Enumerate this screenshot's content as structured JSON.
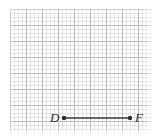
{
  "figure": {
    "width": 157,
    "height": 136,
    "background_color": "#ffffff"
  },
  "grid": {
    "major_line_color": "#b9b9bd",
    "minor_line_color": "#e2e2e6",
    "major_spacing_px": 16,
    "minor_spacing_px": 4,
    "columns": 9,
    "rows": 8,
    "left_px": 10,
    "top_px": 9,
    "width_px": 142,
    "height_px": 124
  },
  "segment": {
    "stroke_color": "#3a3a3a",
    "stroke_width_px": 1.6,
    "endpoint_radius_px": 2.2,
    "x1": 64,
    "y1": 118,
    "x2": 130,
    "y2": 118,
    "length_cells": 4,
    "endpoints": [
      {
        "label": "D",
        "x": 64,
        "y": 118,
        "label_x": 50,
        "label_y": 111
      },
      {
        "label": "F",
        "x": 130,
        "y": 118,
        "label_x": 135,
        "label_y": 111
      }
    ]
  },
  "chart_data": {
    "type": "scatter",
    "xlabel": "",
    "ylabel": "",
    "grid": true,
    "legend": null,
    "annotations": [
      "D",
      "F"
    ],
    "series": [
      {
        "name": "segment DF",
        "x": [
          64,
          130
        ],
        "y": [
          118,
          118
        ],
        "point_labels": [
          "D",
          "F"
        ]
      }
    ]
  }
}
